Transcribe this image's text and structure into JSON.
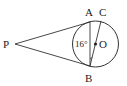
{
  "diagram": {
    "type": "geometry",
    "points": {
      "P": {
        "label": "P",
        "x": 15,
        "y": 44
      },
      "A": {
        "label": "A",
        "x": 90,
        "y": 22
      },
      "B": {
        "label": "B",
        "x": 90,
        "y": 66
      },
      "C": {
        "label": "C",
        "x": 101,
        "y": 21
      },
      "O": {
        "label": "O",
        "x": 95.5,
        "y": 44
      }
    },
    "circle": {
      "center": "O",
      "cx": 95.5,
      "cy": 44,
      "r": 23
    },
    "segments": [
      {
        "from": "P",
        "to": "A"
      },
      {
        "from": "P",
        "to": "B"
      },
      {
        "from": "A",
        "to": "B"
      },
      {
        "from": "B",
        "to": "C"
      }
    ],
    "angle_label": "16°",
    "stroke_color": "#333333"
  }
}
